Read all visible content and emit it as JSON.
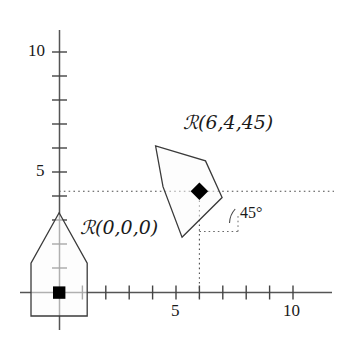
{
  "figure": {
    "type": "diagram",
    "background": "#ffffff",
    "stroke_color": "#333333",
    "dotted_color": "#555555",
    "marker_color": "#000000",
    "width": 338,
    "height": 350
  },
  "axes": {
    "origin_px": {
      "x": 59,
      "y": 292
    },
    "unit_px": {
      "x": 23.4,
      "y": 24.0
    },
    "x_axis": {
      "label_ticks": [
        {
          "value": "5",
          "at": 5
        },
        {
          "value": "10",
          "at": 10
        }
      ],
      "minor_ticks": [
        1,
        2,
        3,
        4,
        5,
        6,
        7,
        8,
        9,
        10
      ],
      "range": [
        0,
        11.2
      ]
    },
    "y_axis": {
      "label_ticks": [
        {
          "value": "5",
          "at": 5
        },
        {
          "value": "10",
          "at": 10
        }
      ],
      "minor_ticks": [
        1,
        2,
        3,
        4,
        5,
        6,
        7,
        8,
        9,
        10
      ],
      "range": [
        0,
        11.0
      ]
    }
  },
  "shapes": [
    {
      "name": "pentagon-unrotated",
      "label": "ℛ(0,0,0)",
      "center": {
        "x": 0,
        "y": 0
      },
      "rotation_deg": 0,
      "anchor_marker": "square",
      "vertices_data": [
        {
          "x": -1.2,
          "y": -1.0
        },
        {
          "x": 1.2,
          "y": -1.0
        },
        {
          "x": 1.2,
          "y": 1.2
        },
        {
          "x": 0.0,
          "y": 3.3
        },
        {
          "x": -1.2,
          "y": 1.2
        }
      ]
    },
    {
      "name": "pentagon-rotated",
      "label": "ℛ(6,4,45)",
      "center": {
        "x": 6,
        "y": 4
      },
      "rotation_deg": 45,
      "anchor_marker": "diamond",
      "vertices_data": [
        {
          "x": -1.2,
          "y": -1.0
        },
        {
          "x": 1.2,
          "y": -1.0
        },
        {
          "x": 1.2,
          "y": 1.2
        },
        {
          "x": 0.0,
          "y": 3.3
        },
        {
          "x": -1.2,
          "y": 1.2
        }
      ]
    }
  ],
  "annotations": {
    "angle_label": "45°",
    "angle_value_deg": 45,
    "label_origin_shape": "ℛ(0,0,0)",
    "label_rotated_shape": "ℛ(6,4,45)",
    "y_label_10": "10",
    "y_label_5": "5",
    "x_label_5": "5",
    "x_label_10": "10"
  },
  "guides": {
    "horizontal_dotted_y": 4,
    "vertical_dotted_x": 6,
    "description": "dotted construction lines through center (6,4) to axes"
  }
}
